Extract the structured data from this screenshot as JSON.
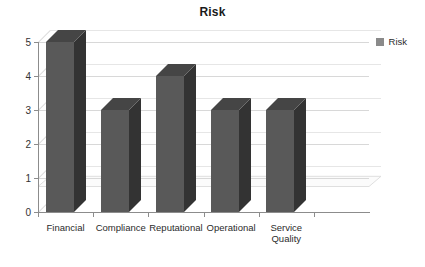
{
  "chart_data": {
    "type": "bar",
    "title": "Risk",
    "xlabel": "",
    "ylabel": "",
    "categories": [
      "Financial",
      "Compliance",
      "Reputational",
      "Operational",
      "Service\nQuality",
      ""
    ],
    "values": [
      5,
      3,
      4,
      3,
      3,
      null
    ],
    "ylim": [
      0,
      5
    ],
    "yticks": [
      0,
      1,
      2,
      3,
      4,
      5
    ],
    "ytick_labels": [
      "0",
      "1",
      "2",
      "3",
      "4",
      "5"
    ],
    "grid": true,
    "legend_position": "top-right",
    "series": [
      {
        "name": "Risk",
        "values": [
          5,
          3,
          4,
          3,
          3,
          null
        ]
      }
    ],
    "style": "3d-column",
    "colors": {
      "bar_front": "#595959",
      "bar_side": "#333333",
      "bar_top": "#454545",
      "gridline": "#d8d8d8",
      "axis": "#8c8c8c",
      "background": "#ffffff",
      "text": "#2b2b2b",
      "legend_swatch": "#8a8a8a"
    }
  },
  "legend": {
    "entries": [
      {
        "label": "Risk",
        "color": "#8a8a8a"
      }
    ]
  },
  "axis": {
    "y_labels": [
      "5",
      "4",
      "3",
      "2",
      "1",
      "0"
    ],
    "x_labels": [
      "Financial",
      "Compliance",
      "Reputational",
      "Operational",
      "Service\nQuality"
    ]
  }
}
